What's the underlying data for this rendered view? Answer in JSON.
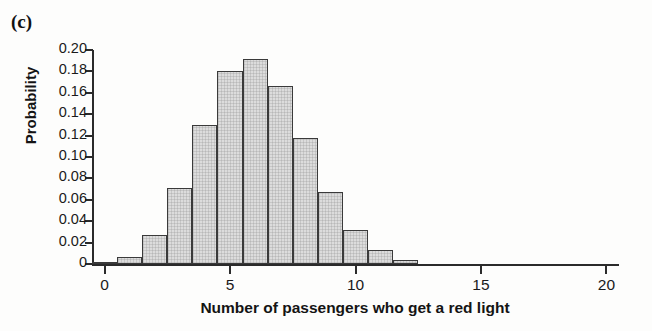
{
  "panel": {
    "label": "(c)"
  },
  "chart_data": {
    "type": "bar",
    "title": "",
    "subtitle": "",
    "xlabel": "Number of passengers who get a red light",
    "ylabel": "Probability",
    "categories": [
      0,
      1,
      2,
      3,
      4,
      5,
      6,
      7,
      8,
      9,
      10,
      11,
      12
    ],
    "values": [
      0.002,
      0.007,
      0.027,
      0.071,
      0.13,
      0.18,
      0.192,
      0.166,
      0.118,
      0.067,
      0.032,
      0.013,
      0.004
    ],
    "xlim": [
      -0.5,
      20.5
    ],
    "ylim": [
      0,
      0.2
    ],
    "x_ticks": [
      0,
      5,
      10,
      15,
      20
    ],
    "x_tick_labels": [
      "0",
      "5",
      "10",
      "15",
      "20"
    ],
    "y_ticks": [
      0,
      0.02,
      0.04,
      0.06,
      0.08,
      0.1,
      0.12,
      0.14,
      0.16,
      0.18,
      0.2
    ],
    "y_tick_labels": [
      "0",
      "0.02",
      "0.04",
      "0.06",
      "0.08",
      "0.10",
      "0.12",
      "0.14",
      "0.16",
      "0.18",
      "0.20"
    ],
    "grid": false,
    "legend": null,
    "bar_width_units": 1,
    "colors": {
      "bar_fill": "#dcdcdc",
      "bar_edge": "#3a3a3a",
      "axis": "#2b2b2b",
      "text": "#1a1a1a",
      "background": "#fdfdfc"
    }
  }
}
